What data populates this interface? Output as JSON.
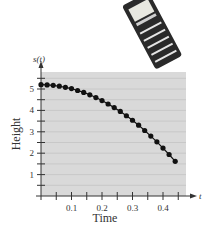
{
  "chart_data": {
    "type": "scatter",
    "title": "",
    "xlabel": "Time",
    "ylabel": "Height",
    "x_axis_var": "t",
    "y_axis_var": "s(t)",
    "xlim": [
      0,
      0.47
    ],
    "ylim": [
      0,
      5.75
    ],
    "x_ticks": [
      0.1,
      0.2,
      0.3,
      0.4
    ],
    "x_minor_ticks": [
      0.05,
      0.15,
      0.25,
      0.35,
      0.45
    ],
    "y_ticks": [
      1,
      2,
      3,
      4,
      5
    ],
    "y_minor_ticks": [
      0.5,
      1.5,
      2.5,
      3.5,
      4.5,
      5.5
    ],
    "grid": true,
    "legend": null,
    "series": [
      {
        "name": "s(t)",
        "connected": true,
        "x": [
          0,
          0.02,
          0.04,
          0.06,
          0.08,
          0.1,
          0.12,
          0.14,
          0.16,
          0.18,
          0.2,
          0.22,
          0.24,
          0.26,
          0.28,
          0.3,
          0.32,
          0.34,
          0.36,
          0.38,
          0.4,
          0.42,
          0.44
        ],
        "values": [
          5.2,
          5.19,
          5.17,
          5.13,
          5.08,
          5.02,
          4.93,
          4.84,
          4.73,
          4.6,
          4.46,
          4.3,
          4.13,
          3.95,
          3.75,
          3.54,
          3.31,
          3.06,
          2.8,
          2.53,
          2.24,
          1.94,
          1.62
        ]
      }
    ],
    "decoration": "handheld-data-logger-illustration"
  }
}
